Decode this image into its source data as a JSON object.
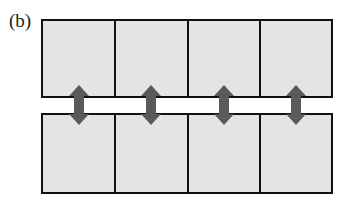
{
  "panel_label": "(b)",
  "colors": {
    "cell_fill": "#e4e4e4",
    "cell_stroke": "#111111",
    "arrow_fill": "#5a5a5a",
    "background": "#ffffff"
  },
  "rows": [
    {
      "name": "top-row",
      "cells": 4
    },
    {
      "name": "bottom-row",
      "cells": 4
    }
  ],
  "arrows": [
    {
      "name": "arrow-1",
      "direction": "bidirectional-vertical"
    },
    {
      "name": "arrow-2",
      "direction": "bidirectional-vertical"
    },
    {
      "name": "arrow-3",
      "direction": "bidirectional-vertical"
    },
    {
      "name": "arrow-4",
      "direction": "bidirectional-vertical"
    }
  ]
}
